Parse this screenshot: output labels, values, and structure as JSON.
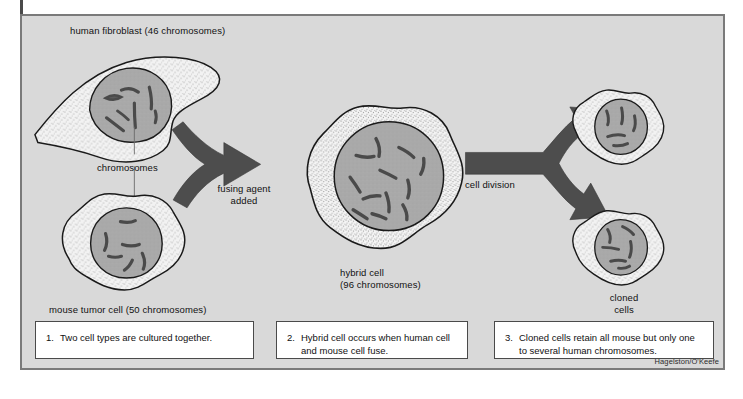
{
  "figure": {
    "title_label": "human fibroblast (46 chromosomes)",
    "credit": "Hagelston/O'Keefe",
    "colors": {
      "panel_background": "#d9d9d9",
      "panel_border": "#7a7a7a",
      "cytoplasm": "#f0f0f0",
      "nucleus": "#a8a8a8",
      "chromosome": "#555555",
      "arrow": "#4d4d4d",
      "caption_background": "#ffffff",
      "caption_border": "#4a4a4a",
      "outline": "#1a1a1a"
    }
  },
  "labels": {
    "human_fibroblast": "human fibroblast (46 chromosomes)",
    "chromosomes": "chromosomes",
    "mouse_tumor_cell": "mouse tumor cell (50 chromosomes)",
    "fusing_agent_line1": "fusing agent",
    "fusing_agent_line2": "added",
    "hybrid_cell_line1": "hybrid cell",
    "hybrid_cell_line2": "(96 chromosomes)",
    "cell_division": "cell division",
    "cloned_cells_line1": "cloned",
    "cloned_cells_line2": "cells"
  },
  "captions": [
    {
      "number": "1.",
      "text": "Two cell types are cultured together."
    },
    {
      "number": "2.",
      "text": "Hybrid cell occurs when human cell and mouse cell fuse."
    },
    {
      "number": "3.",
      "text": "Cloned cells retain all mouse but only one to several human chromosomes."
    }
  ],
  "cells": [
    {
      "name": "human-fibroblast",
      "shape": "spindle",
      "chromosome_count_shown": 7,
      "chromosome_label": "46 chromosomes"
    },
    {
      "name": "mouse-tumor-cell",
      "shape": "amoeboid",
      "chromosome_count_shown": 6,
      "chromosome_label": "50 chromosomes"
    },
    {
      "name": "hybrid-cell",
      "shape": "amoeboid-large",
      "chromosome_count_shown": 12,
      "chromosome_label": "96 chromosomes"
    },
    {
      "name": "cloned-cell-top",
      "shape": "amoeboid-small",
      "chromosome_count_shown": 5,
      "chromosome_label": ""
    },
    {
      "name": "cloned-cell-bottom",
      "shape": "amoeboid-small",
      "chromosome_count_shown": 6,
      "chromosome_label": ""
    }
  ],
  "arrows": [
    {
      "name": "fusion-arrow",
      "direction": "merge-two-into-one"
    },
    {
      "name": "division-arrow",
      "direction": "split-one-into-two"
    }
  ]
}
